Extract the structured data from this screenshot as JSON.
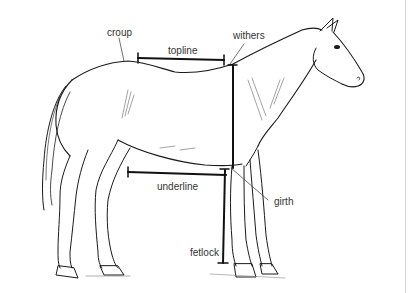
{
  "diagram": {
    "colors": {
      "line": "#1a1a1a",
      "label": "#333333",
      "background": "#ffffff",
      "border": "#d6d6d6"
    },
    "labels": [
      {
        "id": "croup",
        "text": "croup"
      },
      {
        "id": "topline",
        "text": "topline"
      },
      {
        "id": "withers",
        "text": "withers"
      },
      {
        "id": "underline",
        "text": "underline"
      },
      {
        "id": "girth",
        "text": "girth"
      },
      {
        "id": "fetlock",
        "text": "fetlock"
      }
    ],
    "measurements": [
      {
        "id": "topline-bar",
        "orientation": "horizontal"
      },
      {
        "id": "height-bar",
        "orientation": "vertical"
      },
      {
        "id": "underline-bar",
        "orientation": "horizontal"
      },
      {
        "id": "leg-bar",
        "orientation": "vertical"
      }
    ]
  }
}
